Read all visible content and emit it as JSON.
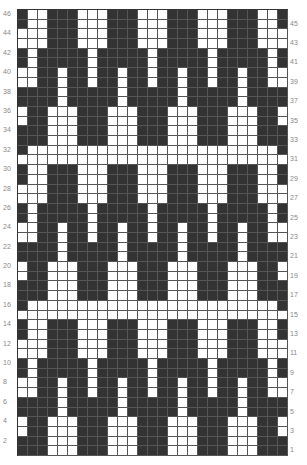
{
  "chart": {
    "title": "",
    "columns": 27,
    "rows": 46,
    "colors": {
      "dark": "#333333",
      "light": "#ffffff",
      "grid": "#555555",
      "label": "#888888"
    },
    "left_labels": [
      "46",
      "44",
      "42",
      "40",
      "38",
      "36",
      "34",
      "32",
      "30",
      "28",
      "26",
      "24",
      "22",
      "20",
      "18",
      "16",
      "14",
      "12",
      "10",
      "8",
      "6",
      "4",
      "2"
    ],
    "right_labels": [
      "45",
      "43",
      "41",
      "39",
      "37",
      "35",
      "33",
      "31",
      "29",
      "27",
      "25",
      "23",
      "21",
      "19",
      "17",
      "15",
      "13",
      "11",
      "9",
      "7",
      "5",
      "3",
      "1"
    ],
    "motif_left_strip_rows_46_to_33": [
      "DWWDDDWW",
      "DWWDDDWW",
      "WWWDDDWW",
      "WWWDDDWW",
      "DWDDDDDW",
      "DWDDDDDW",
      "WWDDWDDD",
      "WWDDWDDD",
      "DDDDWDDD",
      "DDDDWDDD",
      "WDDWWWDD",
      "WDDWWWDD",
      "DDDWWWDD",
      "DDDWWWDD"
    ]
  }
}
